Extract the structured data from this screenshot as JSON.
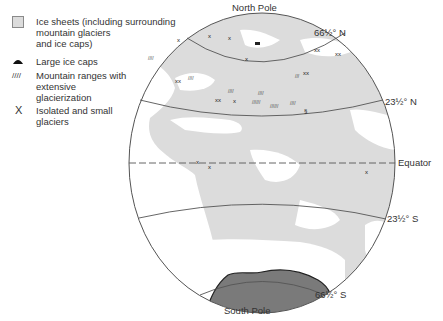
{
  "legend": {
    "items": [
      {
        "symbol": "light-grey-square",
        "text": "Ice sheets (including surrounding\n          mountain glaciers\n          and ice caps)"
      },
      {
        "symbol": "black-dome",
        "text": "Large ice caps"
      },
      {
        "symbol": "hatch-lines",
        "glyph": "////",
        "text": "Mountain ranges with\nextensive\nglacierization"
      },
      {
        "symbol": "x-mark",
        "glyph": "X",
        "text": "Isolated and small\nglaciers"
      }
    ]
  },
  "labels": {
    "north_pole": "North Pole",
    "south_pole": "South Pole",
    "arctic_circle": "66½° N",
    "tropic_cancer": "23½° N",
    "equator": "Equator",
    "tropic_capricorn": "23½° S",
    "antarctic_circle": "66½° S"
  },
  "colors": {
    "land": "#dcdcdc",
    "ocean": "#ffffff",
    "ice_sheet": "#7a7a7a",
    "outline": "#555555"
  }
}
